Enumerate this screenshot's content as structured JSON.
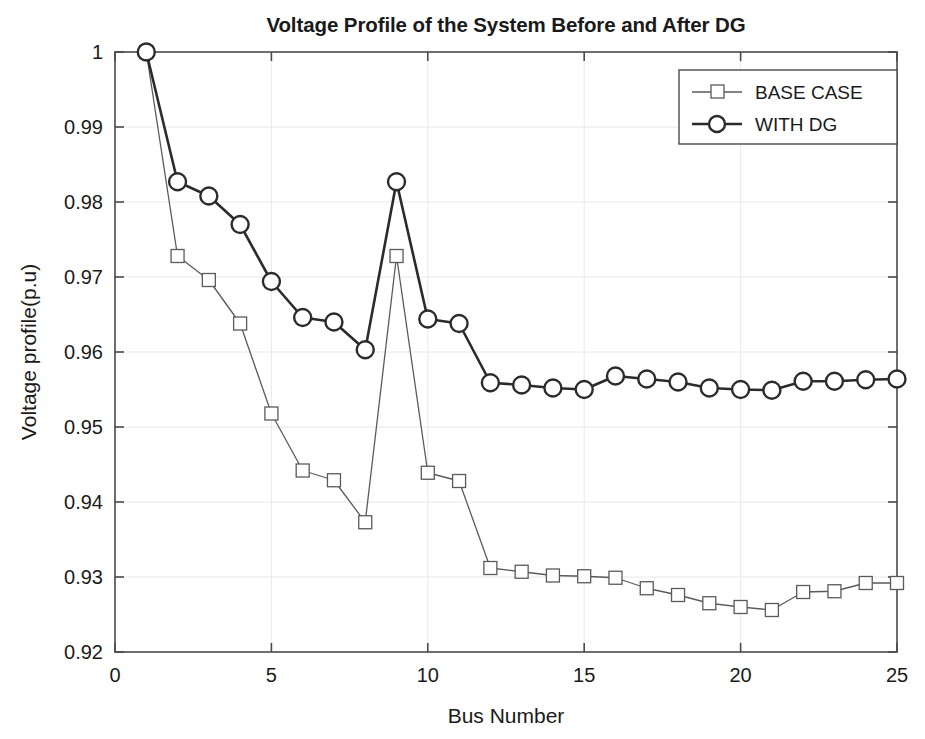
{
  "chart_data": {
    "type": "line",
    "title": "Voltage Profile of the System Before and After DG",
    "xlabel": "Bus Number",
    "ylabel": "Voltage profile(p.u)",
    "xlim": [
      0,
      25
    ],
    "ylim": [
      0.92,
      1
    ],
    "xticks": [
      0,
      5,
      10,
      15,
      20,
      25
    ],
    "xtick_labels": [
      "0",
      "5",
      "10",
      "15",
      "20",
      "25"
    ],
    "yticks": [
      0.92,
      0.93,
      0.94,
      0.95,
      0.96,
      0.97,
      0.98,
      0.99,
      1
    ],
    "ytick_labels": [
      "0.92",
      "0.93",
      "0.94",
      "0.95",
      "0.96",
      "0.97",
      "0.98",
      "0.99",
      "1"
    ],
    "grid": true,
    "legend_position": "top-right",
    "x": [
      1,
      2,
      3,
      4,
      5,
      6,
      7,
      8,
      9,
      10,
      11,
      12,
      13,
      14,
      15,
      16,
      17,
      18,
      19,
      20,
      21,
      22,
      23,
      24,
      25
    ],
    "series": [
      {
        "name": "BASE CASE",
        "marker": "square",
        "color": "#5a5a5a",
        "values": [
          1.0,
          0.9728,
          0.9696,
          0.9638,
          0.9518,
          0.9442,
          0.9429,
          0.9373,
          0.9728,
          0.9439,
          0.9428,
          0.9312,
          0.9307,
          0.9302,
          0.9301,
          0.9299,
          0.9285,
          0.9276,
          0.9265,
          0.926,
          0.9256,
          0.928,
          0.9281,
          0.9292,
          0.9292
        ]
      },
      {
        "name": "WITH DG",
        "marker": "circle",
        "color": "#2b2b2b",
        "values": [
          1.0,
          0.9827,
          0.9808,
          0.977,
          0.9694,
          0.9646,
          0.964,
          0.9603,
          0.9827,
          0.9644,
          0.9638,
          0.9559,
          0.9556,
          0.9552,
          0.955,
          0.9568,
          0.9564,
          0.956,
          0.9552,
          0.955,
          0.9549,
          0.9561,
          0.9561,
          0.9563,
          0.9564
        ]
      }
    ]
  },
  "legend": {
    "entries": [
      {
        "label": "BASE CASE"
      },
      {
        "label": "WITH DG"
      }
    ]
  }
}
